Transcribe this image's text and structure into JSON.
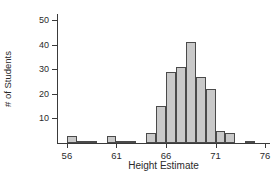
{
  "chart_data": {
    "type": "bar",
    "title": "",
    "subtitle": "",
    "xlabel": "Height Estimate",
    "ylabel": "# of Students",
    "xlim": [
      55.0,
      76.5
    ],
    "ylim": [
      0,
      53
    ],
    "grid": false,
    "legend": null,
    "bin_width": 1,
    "xticks": [
      56,
      61,
      66,
      71,
      76
    ],
    "xtick_labels": [
      "56",
      "61",
      "66",
      "71",
      "76"
    ],
    "yticks": [
      10,
      20,
      30,
      40,
      50
    ],
    "ytick_labels": [
      "10",
      "20",
      "30",
      "40",
      "50"
    ],
    "bar_fill_color": "#c9c9c9",
    "bar_edge_color": "#4a4a4a",
    "axis_color": "#3a3a3a",
    "bins": [
      {
        "left": 56,
        "right": 57,
        "value": 3
      },
      {
        "left": 57,
        "right": 58,
        "value": 1
      },
      {
        "left": 58,
        "right": 59,
        "value": 1
      },
      {
        "left": 60,
        "right": 61,
        "value": 3
      },
      {
        "left": 61,
        "right": 62,
        "value": 1
      },
      {
        "left": 62,
        "right": 63,
        "value": 1
      },
      {
        "left": 64,
        "right": 65,
        "value": 4
      },
      {
        "left": 65,
        "right": 66,
        "value": 15
      },
      {
        "left": 66,
        "right": 67,
        "value": 29
      },
      {
        "left": 67,
        "right": 68,
        "value": 31
      },
      {
        "left": 68,
        "right": 69,
        "value": 41
      },
      {
        "left": 69,
        "right": 70,
        "value": 27
      },
      {
        "left": 70,
        "right": 71,
        "value": 22
      },
      {
        "left": 71,
        "right": 72,
        "value": 5
      },
      {
        "left": 72,
        "right": 73,
        "value": 4
      },
      {
        "left": 74,
        "right": 75,
        "value": 1
      }
    ],
    "categories": [
      "56",
      "57",
      "58",
      "60",
      "61",
      "62",
      "64",
      "65",
      "66",
      "67",
      "68",
      "69",
      "70",
      "71",
      "72",
      "74"
    ],
    "values": [
      3,
      1,
      1,
      3,
      1,
      1,
      4,
      15,
      29,
      31,
      41,
      27,
      22,
      5,
      4,
      1
    ]
  }
}
